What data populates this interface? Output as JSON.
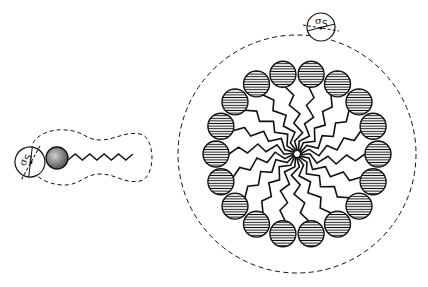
{
  "figure": {
    "colors": {
      "line": "#111111",
      "background": "#ffffff",
      "head_fill": "#ffffff",
      "monomer_head_fill": "#9a9a9a"
    }
  },
  "monomer": {
    "label": "surfactant-monomer",
    "head": {
      "cx": 57,
      "cy": 158,
      "r": 11
    },
    "tail": {
      "x_start": 68,
      "x_end": 133,
      "y": 157,
      "segments": 9,
      "amplitude": 3
    },
    "envelope": "dashed",
    "solvent": {
      "cx": 30,
      "cy": 162,
      "r": 15,
      "symbol": "σ",
      "subscript": "S",
      "rotation": -70
    }
  },
  "micelle": {
    "label": "micelle",
    "center": {
      "x": 297,
      "y": 154
    },
    "envelope_radius": 119,
    "head_ring_radius": 81,
    "head_radius": 13,
    "head_count": 18,
    "head_style": "horizontal-hatch",
    "solvent": {
      "cx": 321,
      "cy": 27,
      "r": 14,
      "symbol": "σ",
      "subscript": "S",
      "rotation": 0
    }
  }
}
